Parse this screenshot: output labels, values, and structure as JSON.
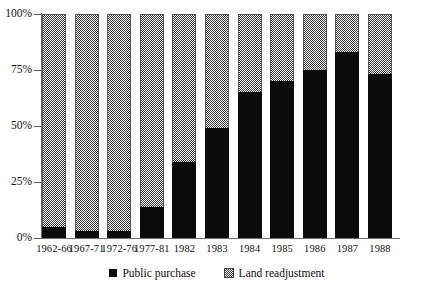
{
  "chart_data": {
    "type": "bar",
    "stacked": true,
    "title": "",
    "xlabel": "",
    "ylabel": "",
    "ylim": [
      0,
      100
    ],
    "ytick_labels": [
      "0%",
      "25%",
      "50%",
      "75%",
      "100%"
    ],
    "ytick_values": [
      0,
      25,
      50,
      75,
      100
    ],
    "grid": false,
    "legend_position": "bottom",
    "categories": [
      "1962-66",
      "1967-71",
      "1972-76",
      "1977-81",
      "1982",
      "1983",
      "1984",
      "1985",
      "1986",
      "1987",
      "1988"
    ],
    "series": [
      {
        "name": "Public purchase",
        "color": "#0b0b0b",
        "pattern": "solid",
        "values": [
          5,
          3,
          3,
          14,
          34,
          49,
          65,
          70,
          75,
          83,
          73
        ]
      },
      {
        "name": "Land readjustment",
        "color": "#3a3a3a",
        "pattern": "checker",
        "values": [
          95,
          97,
          97,
          86,
          66,
          51,
          35,
          30,
          25,
          17,
          27
        ]
      }
    ]
  },
  "axis": {
    "y_labels": [
      "100%",
      "75%",
      "50%",
      "25%",
      "0%"
    ]
  },
  "legend": {
    "items": [
      {
        "label": "Public purchase",
        "swatch": "solid-black-square-icon"
      },
      {
        "label": "Land readjustment",
        "swatch": "checkered-square-icon"
      }
    ]
  }
}
